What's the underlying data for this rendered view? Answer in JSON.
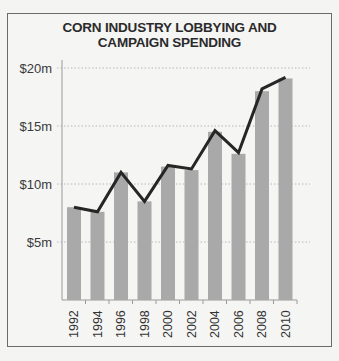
{
  "chart_data": {
    "type": "bar",
    "title": "CORN INDUSTRY LOBBYING AND CAMPAIGN SPENDING",
    "title_lines": [
      "CORN INDUSTRY LOBBYING AND",
      "CAMPAIGN SPENDING"
    ],
    "xlabel": "",
    "ylabel": "",
    "categories": [
      "1992",
      "1994",
      "1996",
      "1998",
      "2000",
      "2002",
      "2004",
      "2006",
      "2008",
      "2010"
    ],
    "series": [
      {
        "name": "Spending (bars)",
        "type": "bar",
        "color": "#a9a9a9",
        "values": [
          8.0,
          7.6,
          11.0,
          8.5,
          11.5,
          11.2,
          14.5,
          12.6,
          18.0,
          19.1
        ]
      },
      {
        "name": "Spending (line)",
        "type": "line",
        "color": "#262626",
        "values": [
          8.0,
          7.6,
          11.0,
          8.5,
          11.6,
          11.3,
          14.6,
          12.7,
          18.2,
          19.2
        ]
      }
    ],
    "yticks": [
      5,
      10,
      15,
      20
    ],
    "ytick_labels": [
      "$5m",
      "$10m",
      "$15m",
      "$20m"
    ],
    "ylim": [
      0,
      20
    ],
    "grid": "horizontal dotted",
    "legend": "none"
  }
}
